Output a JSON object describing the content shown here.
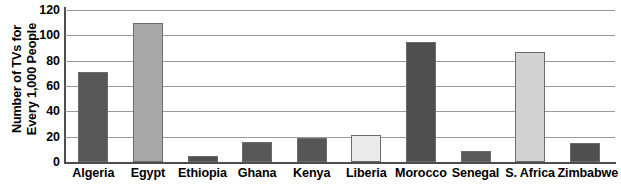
{
  "chart_data": {
    "type": "bar",
    "title": "",
    "subtitle": "",
    "xlabel": "",
    "ylabel": "Number of TVs for Every 1,000 People",
    "ylabel_lines": [
      "Number of TVs for",
      "Every 1,000 People"
    ],
    "ylim": [
      0,
      120
    ],
    "ytick_labels": [
      "120",
      "100",
      "80",
      "60",
      "40",
      "20",
      "0"
    ],
    "ytick_values": [
      120,
      100,
      80,
      60,
      40,
      20,
      0
    ],
    "ytick_step": 20,
    "grid": true,
    "grid_axis": "y",
    "legend": false,
    "legend_position": "none",
    "categories": [
      "Algeria",
      "Egypt",
      "Ethiopia",
      "Ghana",
      "Kenya",
      "Liberia",
      "Morocco",
      "Senegal",
      "S. Africa",
      "Zimbabwe"
    ],
    "values": [
      71,
      110,
      5,
      16,
      19,
      21,
      95,
      9,
      87,
      15
    ],
    "bar_colors": [
      "#575757",
      "#a8a8a8",
      "#4f4f4f",
      "#575757",
      "#565656",
      "#eaeaea",
      "#4f4f4f",
      "#5a5a5a",
      "#d2d2d2",
      "#4f4f4f"
    ],
    "bar_border_color": "#6b6b6b",
    "axis_color": "#4d4d4d",
    "gridline_color": "#9a9a9a",
    "background_color": "#ffffff"
  }
}
